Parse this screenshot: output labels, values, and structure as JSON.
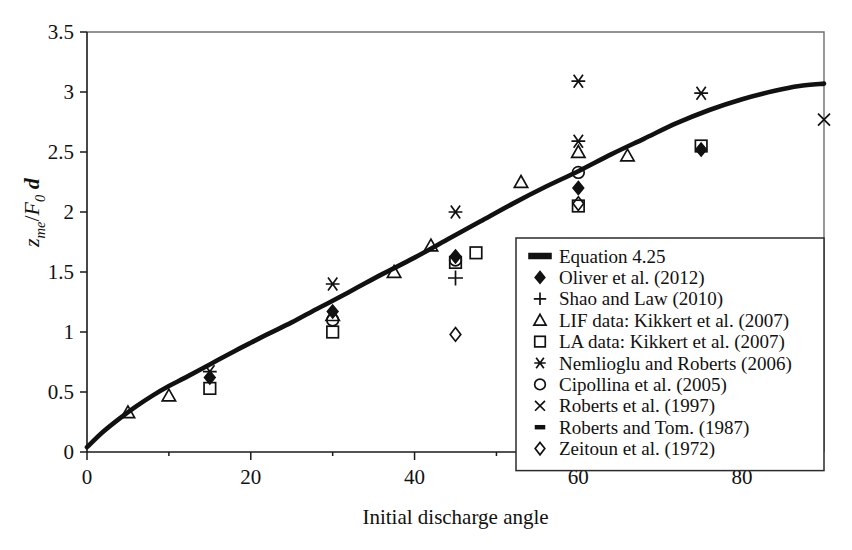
{
  "chart_data": {
    "type": "scatter",
    "title": "",
    "xlabel": "Initial discharge angle",
    "ylabel": "z_me / F_0 d",
    "ylabel_parts": {
      "var": "z",
      "var_sub": "me",
      "slash": "/",
      "denom": "F",
      "denom_sub": "0",
      "tail": "d"
    },
    "xlim": [
      0,
      90
    ],
    "ylim": [
      0,
      3.5
    ],
    "xticks": [
      0,
      20,
      40,
      60,
      80
    ],
    "xtick_labels": [
      "0",
      "20",
      "40",
      "60",
      "80"
    ],
    "xminor_ticks": [
      10,
      30,
      50,
      70
    ],
    "yticks": [
      0,
      0.5,
      1,
      1.5,
      2,
      2.5,
      3,
      3.5
    ],
    "ytick_labels": [
      "0",
      "0.5",
      "1",
      "1.5",
      "2",
      "2.5",
      "3",
      "3.5"
    ],
    "grid": false,
    "legend_position": "inside-lower-right",
    "series": [
      {
        "name": "Equation 4.25",
        "marker": "line",
        "is_curve": true,
        "points": [
          [
            0,
            0.04
          ],
          [
            2,
            0.17
          ],
          [
            4,
            0.28
          ],
          [
            6,
            0.38
          ],
          [
            8,
            0.47
          ],
          [
            10,
            0.55
          ],
          [
            12,
            0.62
          ],
          [
            15,
            0.73
          ],
          [
            18,
            0.84
          ],
          [
            20,
            0.91
          ],
          [
            22,
            0.98
          ],
          [
            25,
            1.08
          ],
          [
            28,
            1.19
          ],
          [
            30,
            1.26
          ],
          [
            33,
            1.37
          ],
          [
            36,
            1.48
          ],
          [
            40,
            1.62
          ],
          [
            44,
            1.77
          ],
          [
            48,
            1.92
          ],
          [
            52,
            2.07
          ],
          [
            56,
            2.21
          ],
          [
            60,
            2.34
          ],
          [
            64,
            2.48
          ],
          [
            68,
            2.61
          ],
          [
            72,
            2.74
          ],
          [
            76,
            2.85
          ],
          [
            80,
            2.94
          ],
          [
            84,
            3.01
          ],
          [
            87,
            3.05
          ],
          [
            90,
            3.07
          ]
        ]
      },
      {
        "name": "Oliver et al. (2012)",
        "marker": "diamond-filled",
        "points": [
          [
            15,
            0.62
          ],
          [
            30,
            1.17
          ],
          [
            45,
            1.63
          ],
          [
            60,
            2.2
          ],
          [
            75,
            2.52
          ]
        ]
      },
      {
        "name": "Shao and Law (2010)",
        "marker": "plus",
        "points": [
          [
            45,
            1.45
          ]
        ]
      },
      {
        "name": "LIF data: Kikkert et al. (2007)",
        "marker": "triangle",
        "points": [
          [
            5,
            0.33
          ],
          [
            10,
            0.47
          ],
          [
            30,
            1.14
          ],
          [
            37.5,
            1.5
          ],
          [
            42,
            1.72
          ],
          [
            53,
            2.25
          ],
          [
            60,
            2.5
          ],
          [
            66,
            2.47
          ]
        ]
      },
      {
        "name": "LA data: Kikkert et al. (2007)",
        "marker": "square",
        "points": [
          [
            15,
            0.53
          ],
          [
            30,
            1.0
          ],
          [
            45,
            1.58
          ],
          [
            47.5,
            1.66
          ],
          [
            60,
            2.05
          ],
          [
            75,
            2.55
          ]
        ]
      },
      {
        "name": "Nemlioglu and Roberts (2006)",
        "marker": "asterisk",
        "points": [
          [
            15,
            0.67
          ],
          [
            30,
            1.4
          ],
          [
            45,
            2.0
          ],
          [
            60,
            2.59
          ],
          [
            60,
            3.09
          ],
          [
            75,
            2.99
          ]
        ]
      },
      {
        "name": "Cipollina et al. (2005)",
        "marker": "circle",
        "points": [
          [
            30,
            1.1
          ],
          [
            45,
            1.6
          ],
          [
            60,
            2.33
          ]
        ]
      },
      {
        "name": "Roberts et al. (1997)",
        "marker": "cross",
        "points": [
          [
            90,
            2.77
          ]
        ]
      },
      {
        "name": "Roberts and Tom. (1987)",
        "marker": "dash",
        "points": []
      },
      {
        "name": "Zeitoun et al. (1972)",
        "marker": "diamond-open",
        "points": [
          [
            45,
            0.98
          ],
          [
            60,
            2.07
          ]
        ]
      }
    ]
  },
  "legend": {
    "entries": [
      {
        "label": "Equation 4.25",
        "marker": "line"
      },
      {
        "label": "Oliver et al. (2012)",
        "marker": "diamond-filled"
      },
      {
        "label": "Shao and Law (2010)",
        "marker": "plus"
      },
      {
        "label": "LIF data: Kikkert et al. (2007)",
        "marker": "triangle"
      },
      {
        "label": "LA data: Kikkert et al. (2007)",
        "marker": "square"
      },
      {
        "label": "Nemlioglu and Roberts (2006)",
        "marker": "asterisk"
      },
      {
        "label": "Cipollina et al. (2005)",
        "marker": "circle"
      },
      {
        "label": "Roberts et al. (1997)",
        "marker": "cross"
      },
      {
        "label": "Roberts and Tom. (1987)",
        "marker": "dash"
      },
      {
        "label": "Zeitoun et al. (1972)",
        "marker": "diamond-open"
      }
    ]
  }
}
